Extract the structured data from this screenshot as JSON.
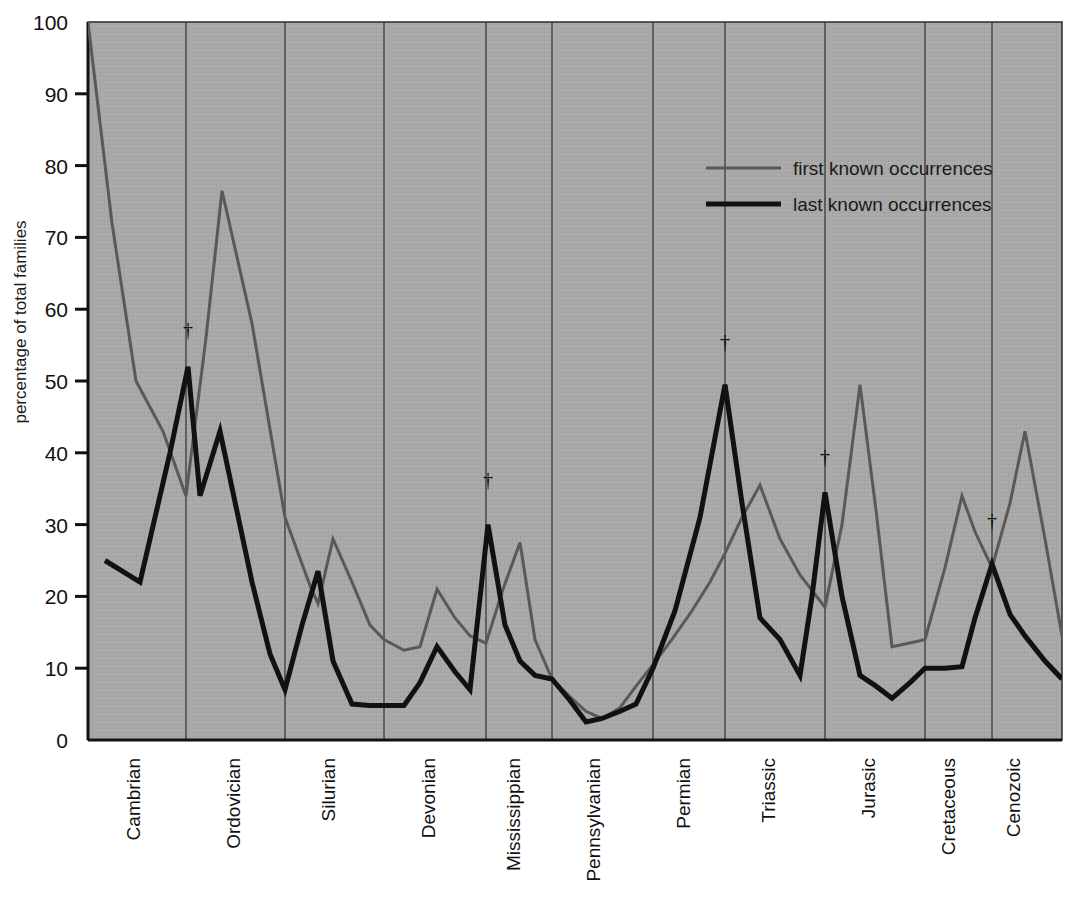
{
  "chart_data": {
    "type": "line",
    "title": "",
    "xlabel": "",
    "ylabel": "percentage of total families",
    "ylim": [
      0,
      100
    ],
    "ytick_labels": [
      "0",
      "10",
      "20",
      "30",
      "40",
      "50",
      "60",
      "70",
      "80",
      "90",
      "100"
    ],
    "ytick_values": [
      0,
      10,
      20,
      30,
      40,
      50,
      60,
      70,
      80,
      90,
      100
    ],
    "grid": false,
    "legend_position": "top-right",
    "categories": [
      "Cambrian",
      "Ordovician",
      "Silurian",
      "Devonian",
      "Mississippian",
      "Pennsylvanian",
      "Permian",
      "Triassic",
      "Jurasic",
      "Cretaceous",
      "Cenozoic"
    ],
    "series": [
      {
        "name": "first known occurrences",
        "color": "#595959",
        "width": 3,
        "points": [
          [
            88,
            100
          ],
          [
            112,
            72
          ],
          [
            136,
            50
          ],
          [
            163,
            43
          ],
          [
            186,
            34
          ],
          [
            206,
            56
          ],
          [
            222,
            76.5
          ],
          [
            252,
            58
          ],
          [
            285,
            31
          ],
          [
            310,
            21.5
          ],
          [
            318,
            19
          ],
          [
            333,
            28
          ],
          [
            352,
            22
          ],
          [
            370,
            16
          ],
          [
            384,
            14
          ],
          [
            404,
            12.5
          ],
          [
            420,
            13
          ],
          [
            437,
            21
          ],
          [
            455,
            17
          ],
          [
            470,
            14.5
          ],
          [
            486,
            13.5
          ],
          [
            503,
            21
          ],
          [
            520,
            27.5
          ],
          [
            535,
            14
          ],
          [
            552,
            8.5
          ],
          [
            570,
            6
          ],
          [
            586,
            4
          ],
          [
            602,
            3
          ],
          [
            620,
            4.5
          ],
          [
            636,
            7.5
          ],
          [
            653,
            10.5
          ],
          [
            672,
            14
          ],
          [
            692,
            18
          ],
          [
            710,
            22
          ],
          [
            725,
            26
          ],
          [
            742,
            31
          ],
          [
            760,
            35.5
          ],
          [
            780,
            28
          ],
          [
            800,
            23
          ],
          [
            825,
            18.5
          ],
          [
            842,
            30
          ],
          [
            860,
            49.5
          ],
          [
            876,
            32
          ],
          [
            892,
            13
          ],
          [
            910,
            13.5
          ],
          [
            925,
            14
          ],
          [
            945,
            24
          ],
          [
            962,
            34
          ],
          [
            975,
            29
          ],
          [
            992,
            24
          ],
          [
            1010,
            33
          ],
          [
            1025,
            43
          ],
          [
            1045,
            28
          ],
          [
            1062,
            14.5
          ]
        ]
      },
      {
        "name": "last known occurrences",
        "color": "#111111",
        "width": 5,
        "points": [
          [
            105,
            25
          ],
          [
            140,
            22
          ],
          [
            170,
            40
          ],
          [
            188,
            52
          ],
          [
            200,
            34
          ],
          [
            220,
            43
          ],
          [
            252,
            22
          ],
          [
            270,
            12
          ],
          [
            285,
            7
          ],
          [
            302,
            16
          ],
          [
            318,
            23.5
          ],
          [
            333,
            11
          ],
          [
            352,
            5
          ],
          [
            370,
            4.8
          ],
          [
            384,
            4.8
          ],
          [
            404,
            4.8
          ],
          [
            420,
            8
          ],
          [
            437,
            13
          ],
          [
            455,
            9.5
          ],
          [
            470,
            7
          ],
          [
            488,
            30
          ],
          [
            505,
            16
          ],
          [
            520,
            11
          ],
          [
            535,
            9
          ],
          [
            552,
            8.5
          ],
          [
            570,
            5.5
          ],
          [
            586,
            2.5
          ],
          [
            602,
            3
          ],
          [
            620,
            4
          ],
          [
            636,
            5
          ],
          [
            653,
            10
          ],
          [
            675,
            18
          ],
          [
            700,
            31
          ],
          [
            725,
            49.5
          ],
          [
            742,
            33
          ],
          [
            760,
            17
          ],
          [
            780,
            14
          ],
          [
            800,
            9
          ],
          [
            812,
            20
          ],
          [
            825,
            34.5
          ],
          [
            842,
            20
          ],
          [
            860,
            9
          ],
          [
            876,
            7.5
          ],
          [
            892,
            5.8
          ],
          [
            910,
            8
          ],
          [
            925,
            10
          ],
          [
            945,
            10
          ],
          [
            962,
            10.2
          ],
          [
            975,
            17
          ],
          [
            992,
            24.5
          ],
          [
            1010,
            17.5
          ],
          [
            1025,
            14.5
          ],
          [
            1045,
            11
          ],
          [
            1062,
            8.5
          ]
        ]
      }
    ],
    "period_boundaries": [
      186,
      285,
      384,
      486,
      552,
      653,
      725,
      825,
      925,
      992
    ],
    "period_label_x": [
      140,
      240,
      335,
      435,
      520,
      600,
      690,
      775,
      875,
      955,
      1020
    ],
    "extinction_markers": [
      {
        "x": 188,
        "y": 337,
        "symbol": "†"
      },
      {
        "x": 488,
        "y": 487,
        "symbol": "†"
      },
      {
        "x": 725,
        "y": 349,
        "symbol": "†"
      },
      {
        "x": 825,
        "y": 464,
        "symbol": "†"
      },
      {
        "x": 992,
        "y": 528,
        "symbol": "†"
      }
    ],
    "plot_area": {
      "left": 88,
      "top": 22,
      "right": 1062,
      "bottom": 740
    },
    "background_color": "#a8a8a8",
    "legend": [
      {
        "label": "first known occurrences",
        "color": "#595959",
        "width": 3
      },
      {
        "label": "last known occurrences",
        "color": "#111111",
        "width": 5
      }
    ]
  }
}
